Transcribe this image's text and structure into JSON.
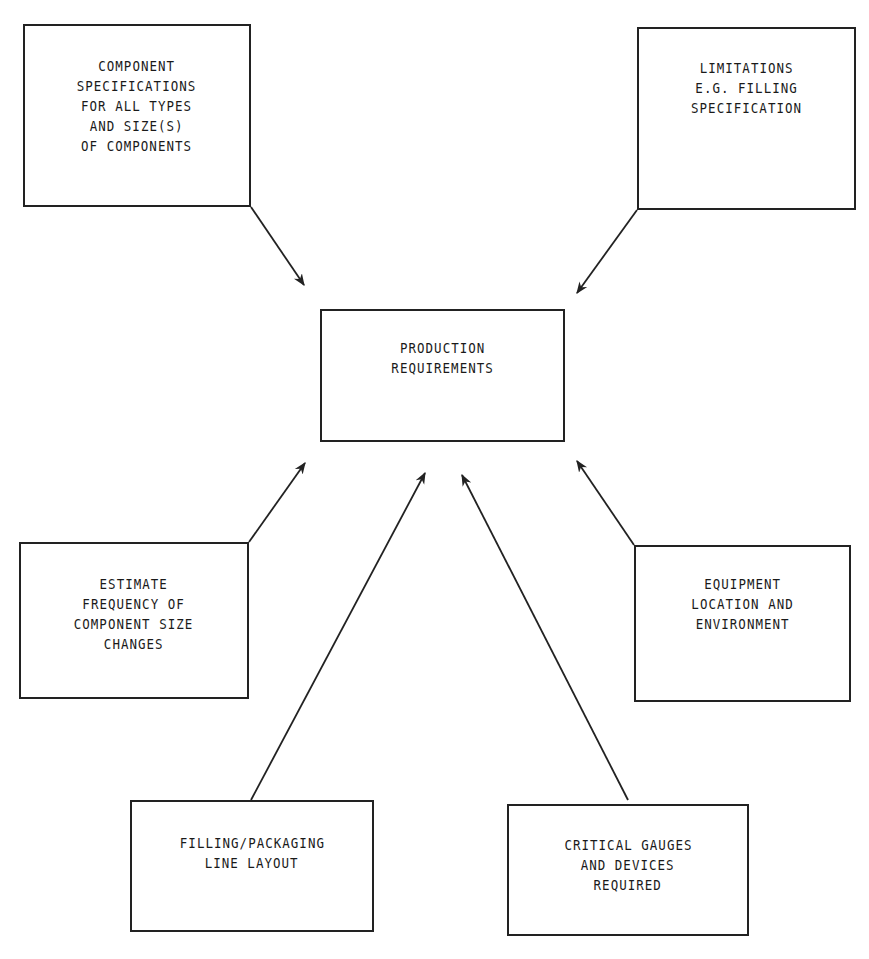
{
  "diagram": {
    "central_node": {
      "id": "production",
      "lines": [
        "PRODUCTION",
        "REQUIREMENTS"
      ]
    },
    "input_nodes": [
      {
        "id": "component-specs",
        "lines": [
          "COMPONENT",
          "SPECIFICATIONS",
          "FOR ALL TYPES",
          "AND SIZE(S)",
          "OF COMPONENTS"
        ]
      },
      {
        "id": "limitations",
        "lines": [
          "LIMITATIONS",
          "E.G. FILLING",
          "SPECIFICATION"
        ]
      },
      {
        "id": "estimate",
        "lines": [
          "ESTIMATE",
          "FREQUENCY OF",
          "COMPONENT SIZE",
          "CHANGES"
        ]
      },
      {
        "id": "equipment",
        "lines": [
          "EQUIPMENT",
          "LOCATION AND",
          "ENVIRONMENT"
        ]
      },
      {
        "id": "filling",
        "lines": [
          "FILLING/PACKAGING",
          "LINE LAYOUT"
        ]
      },
      {
        "id": "critical",
        "lines": [
          "CRITICAL GAUGES",
          "AND DEVICES",
          "REQUIRED"
        ]
      }
    ],
    "edges": [
      {
        "from": "component-specs",
        "to": "production"
      },
      {
        "from": "limitations",
        "to": "production"
      },
      {
        "from": "estimate",
        "to": "production"
      },
      {
        "from": "filling",
        "to": "production"
      },
      {
        "from": "critical",
        "to": "production"
      },
      {
        "from": "equipment",
        "to": "production"
      }
    ],
    "colors": {
      "line": "#222222",
      "background": "#ffffff",
      "text": "#1a1a1a"
    }
  }
}
